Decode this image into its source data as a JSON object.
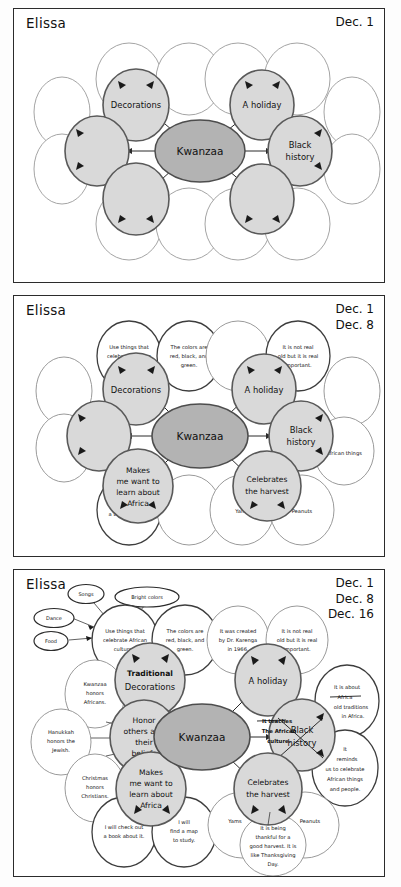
{
  "worksheet": {
    "student_name": "Elissa",
    "title": "Kwanzaa concept map - three revision stages"
  },
  "colors": {
    "core_node_fill": "#b3b3b3",
    "main_node_fill": "#d9d9d9",
    "blank_node_fill": "#ffffff",
    "ink": "#1a1a1a"
  },
  "panels": [
    {
      "id": "panel-1",
      "student_name": "Elissa",
      "dates": [
        "Dec. 1"
      ],
      "core": "Kwanzaa",
      "main_nodes": [
        {
          "key": "decorations",
          "label": "Decorations",
          "filled": true
        },
        {
          "key": "holiday",
          "label": "A holiday",
          "filled": true
        },
        {
          "key": "black-history",
          "label": "Black\nhistory",
          "filled": true
        },
        {
          "key": "left-blank",
          "label": "",
          "filled": true
        },
        {
          "key": "lower-left-blank",
          "label": "",
          "filled": true
        },
        {
          "key": "lower-right-blank",
          "label": "",
          "filled": true
        }
      ],
      "detail_nodes_empty_count": 12
    },
    {
      "id": "panel-2",
      "student_name": "Elissa",
      "dates": [
        "Dec. 1",
        "Dec. 8"
      ],
      "core": "Kwanzaa",
      "main_nodes": [
        {
          "key": "decorations",
          "label": "Decorations"
        },
        {
          "key": "holiday",
          "label": "A holiday"
        },
        {
          "key": "black-history",
          "label": "Black\nhistory"
        },
        {
          "key": "left-blank",
          "label": ""
        },
        {
          "key": "makes-me-want",
          "label": "Makes\nme want to\nlearn about\nAfrica"
        },
        {
          "key": "celebrates-harvest",
          "label": "Celebrates\nthe harvest"
        }
      ],
      "detail_nodes": [
        {
          "key": "use-things",
          "label": "Use things that\ncelebrate African\ncultures."
        },
        {
          "key": "colors-are",
          "label": "The colors are\nred, black, and\ngreen."
        },
        {
          "key": "not-real-old",
          "label": "It is not real\nold but it is real\nimportant."
        },
        {
          "key": "african-things",
          "label": "African things"
        },
        {
          "key": "check-out-book",
          "label": "I will check out\na book about it."
        },
        {
          "key": "yams",
          "label": "Yams"
        },
        {
          "key": "peanuts",
          "label": "Peanuts"
        }
      ],
      "empty_detail_count": 6
    },
    {
      "id": "panel-3",
      "student_name": "Elissa",
      "dates": [
        "Dec. 1",
        "Dec. 8",
        "Dec. 16"
      ],
      "core": "Kwanzaa",
      "main_nodes": [
        {
          "key": "traditional-decorations",
          "label_line1": "Traditional",
          "label_line2": "Decorations"
        },
        {
          "key": "holiday",
          "label": "A holiday"
        },
        {
          "key": "black-history",
          "label": "Black\nhistory",
          "struck_through": true
        },
        {
          "key": "honor-others",
          "label": "Honor\nothers and\ntheir\nbeliefs"
        },
        {
          "key": "makes-me-want",
          "label": "Makes\nme want to\nlearn about\nAfrica"
        },
        {
          "key": "celebrates-harvest",
          "label": "Celebrates\nthe harvest"
        }
      ],
      "annotation": {
        "key": "it-teaches-african-culture",
        "text": "It teaches\nThe African\nculture."
      },
      "detail_nodes": [
        {
          "key": "use-things",
          "label": "Use things that\ncelebrate African\ncultures."
        },
        {
          "key": "colors-are",
          "label": "The colors are\nred, black, and\ngreen."
        },
        {
          "key": "created-by-karenga",
          "label": "It was created\nby Dr. Karenga\nin 1966."
        },
        {
          "key": "not-real-old",
          "label": "It is not real\nold but it is real\nimportant."
        },
        {
          "key": "about-old-traditions",
          "label": "It is about\nAfrica\nold traditions\nin Africa.",
          "struck_word": "Africa"
        },
        {
          "key": "reminds-us",
          "label": "It\nreminds\nus to celebrate\nAfrican things\nand people."
        },
        {
          "key": "kwanzaa-honors",
          "label": "Kwanzaa\nhonors\nAfricans."
        },
        {
          "key": "hanukkah-honors",
          "label": "Hanukkah\nhonors the\nJewish."
        },
        {
          "key": "christmas-honors",
          "label": "Christmas\nhonors\nChristians."
        },
        {
          "key": "check-out-book",
          "label": "I will check out\na book about it."
        },
        {
          "key": "find-a-map",
          "label": "I will\nfind a map\nto study."
        },
        {
          "key": "yams",
          "label": "Yams"
        },
        {
          "key": "peanuts",
          "label": "Peanuts"
        },
        {
          "key": "thankful-harvest",
          "label": "It is being\nthankful for a\ngood harvest. It is\nlike Thanksgiving\nDay."
        }
      ],
      "tiny_nodes": [
        {
          "key": "songs",
          "label": "Songs"
        },
        {
          "key": "bright-colors",
          "label": "Bright colors"
        },
        {
          "key": "dance",
          "label": "Dance"
        },
        {
          "key": "food",
          "label": "Food"
        }
      ]
    }
  ]
}
